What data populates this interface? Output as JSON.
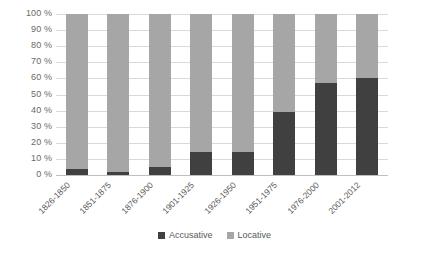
{
  "chart_data": {
    "type": "bar",
    "stacked": true,
    "stack_total": 100,
    "title": "",
    "subtitle": "",
    "xlabel": "",
    "ylabel": "",
    "ylim": [
      0,
      100
    ],
    "grid": true,
    "legend_position": "bottom",
    "categories": [
      "1826-1850",
      "1851-1875",
      "1876-1900",
      "1901-1925",
      "1926-1950",
      "1951-1975",
      "1976-2000",
      "2001-2012"
    ],
    "y_ticks": [
      0,
      10,
      20,
      30,
      40,
      50,
      60,
      70,
      80,
      90,
      100
    ],
    "y_tick_labels": [
      "0 %",
      "10 %",
      "20 %",
      "30 %",
      "40 %",
      "50 %",
      "60 %",
      "70 %",
      "80 %",
      "90 %",
      "100 %"
    ],
    "series": [
      {
        "name": "Accusative",
        "color": "#404040",
        "values": [
          4,
          2,
          5,
          14,
          14,
          39,
          57,
          60
        ]
      },
      {
        "name": "Locative",
        "color": "#a6a6a6",
        "values": [
          96,
          98,
          95,
          86,
          86,
          61,
          43,
          40
        ]
      }
    ]
  },
  "legend": {
    "items": [
      {
        "label": "Accusative",
        "color": "#404040"
      },
      {
        "label": "Locative",
        "color": "#a6a6a6"
      }
    ]
  },
  "colors": {
    "accusative": "#404040",
    "locative": "#a6a6a6",
    "gridline": "#d9d9d9",
    "axis": "#bfbfbf",
    "tick_text": "#6a6a6a",
    "background": "#ffffff"
  }
}
